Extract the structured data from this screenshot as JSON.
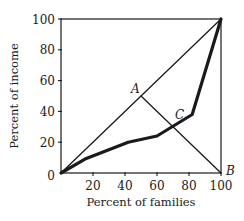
{
  "chart_data": {
    "type": "line",
    "title": "",
    "xlabel": "Percent of families",
    "ylabel": "Percent of income",
    "xlim": [
      0,
      100
    ],
    "ylim": [
      0,
      100
    ],
    "grid": false,
    "legend": null,
    "x_ticks": [
      20,
      40,
      60,
      80,
      100
    ],
    "y_ticks": [
      0,
      20,
      40,
      60,
      80,
      100
    ],
    "x_tick_labels": [
      "20",
      "40",
      "60",
      "80",
      "100"
    ],
    "y_tick_labels": [
      "0",
      "20",
      "40",
      "60",
      "80",
      "100"
    ],
    "series": [
      {
        "name": "Line of equality",
        "style": "thin",
        "x": [
          0,
          100
        ],
        "y": [
          0,
          100
        ]
      },
      {
        "name": "Lorenz curve",
        "style": "thick",
        "x": [
          0,
          15,
          42,
          60,
          82,
          100
        ],
        "y": [
          0,
          9,
          20,
          24,
          38,
          100
        ]
      },
      {
        "name": "Line AB",
        "style": "thin",
        "x": [
          50,
          100
        ],
        "y": [
          50,
          0
        ]
      }
    ],
    "annotations": [
      {
        "label": "A",
        "x": 50,
        "y": 50
      },
      {
        "label": "B",
        "x": 100,
        "y": 0
      },
      {
        "label": "C",
        "x": 70,
        "y": 30
      }
    ]
  }
}
